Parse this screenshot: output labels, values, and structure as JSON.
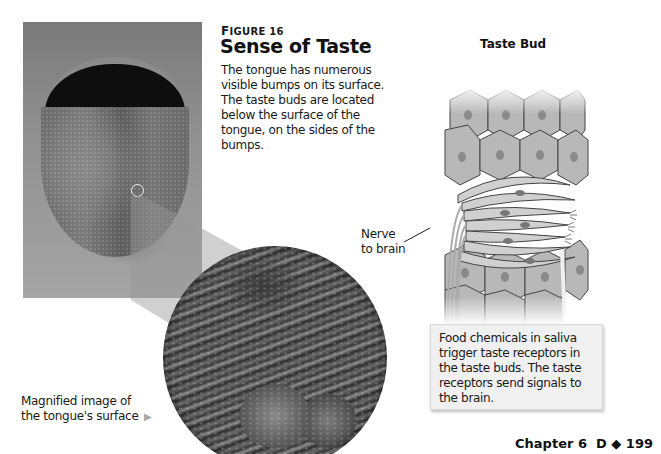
{
  "figure": {
    "label_first_letter": "F",
    "label_rest": "IGURE 16",
    "title": "Sense of Taste",
    "body": "The tongue has numerous visible bumps on its surface. The taste buds are located below the surface of the tongue, on the sides of the bumps."
  },
  "photo": {
    "alt": "Photograph of a person sticking out their tongue",
    "locator": "small circle marking magnified area"
  },
  "magnified": {
    "alt": "Magnified image of the tongue's surface",
    "caption_line1": "Magnified image of",
    "caption_line2": "the tongue's surface",
    "arrow_icon": "▶"
  },
  "taste_bud": {
    "title": "Taste Bud",
    "nerve_label_line1": "Nerve",
    "nerve_label_line2": "to brain",
    "callout": "Food chemicals in saliva trigger taste receptors in the taste buds. The taste receptors send signals to the brain."
  },
  "folio": {
    "chapter": "Chapter 6",
    "section": "D",
    "separator_icon": "◆",
    "page": "199"
  },
  "colors": {
    "text": "#1a1a1a",
    "callout_bg": "#f0f0f0",
    "arrow": "#a8a8a8"
  }
}
